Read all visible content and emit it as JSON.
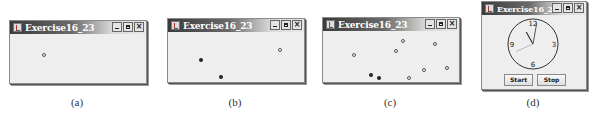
{
  "windows": [
    {
      "id": "a",
      "title": "Exercise16_23",
      "caption": "(a)",
      "balls": [
        {
          "x": 0.25,
          "y": 0.43,
          "style": "hollow"
        }
      ]
    },
    {
      "id": "b",
      "title": "Exercise16_23",
      "caption": "(b)",
      "balls": [
        {
          "x": 0.82,
          "y": 0.35,
          "style": "hollow"
        },
        {
          "x": 0.24,
          "y": 0.55,
          "style": "filled"
        },
        {
          "x": 0.39,
          "y": 0.9,
          "style": "filled"
        }
      ]
    },
    {
      "id": "c",
      "title": "Exercise16_23",
      "caption": "(c)",
      "balls": [
        {
          "x": 0.59,
          "y": 0.19,
          "style": "hollow"
        },
        {
          "x": 0.82,
          "y": 0.26,
          "style": "hollow"
        },
        {
          "x": 0.54,
          "y": 0.4,
          "style": "hollow"
        },
        {
          "x": 0.23,
          "y": 0.48,
          "style": "hollow"
        },
        {
          "x": 0.74,
          "y": 0.76,
          "style": "hollow"
        },
        {
          "x": 0.91,
          "y": 0.72,
          "style": "hollow"
        },
        {
          "x": 0.35,
          "y": 0.87,
          "style": "filled"
        },
        {
          "x": 0.41,
          "y": 0.92,
          "style": "filled"
        },
        {
          "x": 0.63,
          "y": 0.92,
          "style": "hollow"
        }
      ]
    }
  ],
  "clock_window": {
    "title": "Exercise16_24",
    "caption": "(d)",
    "clock": {
      "numerals": [
        "12",
        "3",
        "6",
        "9"
      ],
      "hour": 11,
      "minute": 1,
      "second": 41
    },
    "buttons": {
      "start": "Start",
      "stop": "Stop"
    }
  }
}
